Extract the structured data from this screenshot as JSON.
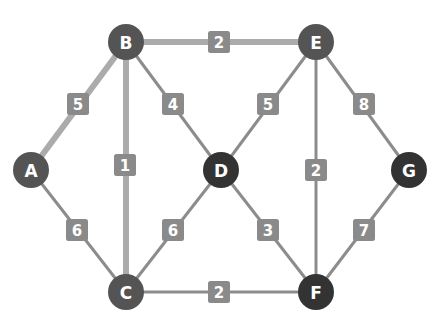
{
  "graph": {
    "title": "Weighted undirected graph",
    "colors": {
      "background": "#ffffff",
      "node_medium": "#545454",
      "node_dark": "#333333",
      "edge_normal": "#8c8c8c",
      "edge_highlight": "#ababab",
      "label_box": "#8a8a8a",
      "label_text": "#ffffff"
    },
    "nodes": [
      {
        "id": "A",
        "label": "A",
        "x": 31,
        "y": 170,
        "tone": "medium"
      },
      {
        "id": "B",
        "label": "B",
        "x": 126,
        "y": 42,
        "tone": "medium"
      },
      {
        "id": "C",
        "label": "C",
        "x": 126,
        "y": 292,
        "tone": "medium"
      },
      {
        "id": "D",
        "label": "D",
        "x": 221,
        "y": 170,
        "tone": "dark"
      },
      {
        "id": "E",
        "label": "E",
        "x": 316,
        "y": 42,
        "tone": "medium"
      },
      {
        "id": "F",
        "label": "F",
        "x": 316,
        "y": 292,
        "tone": "dark"
      },
      {
        "id": "G",
        "label": "G",
        "x": 409,
        "y": 170,
        "tone": "dark"
      }
    ],
    "edges": [
      {
        "from": "A",
        "to": "B",
        "weight": "5",
        "highlighted": true,
        "label_x": 78,
        "label_y": 104
      },
      {
        "from": "B",
        "to": "E",
        "weight": "2",
        "highlighted": true,
        "label_x": 219,
        "label_y": 42
      },
      {
        "from": "B",
        "to": "C",
        "weight": "1",
        "highlighted": true,
        "label_x": 125,
        "label_y": 165
      },
      {
        "from": "B",
        "to": "D",
        "weight": "4",
        "highlighted": false,
        "label_x": 173,
        "label_y": 104
      },
      {
        "from": "A",
        "to": "C",
        "weight": "6",
        "highlighted": false,
        "label_x": 77,
        "label_y": 230
      },
      {
        "from": "C",
        "to": "D",
        "weight": "6",
        "highlighted": false,
        "label_x": 173,
        "label_y": 230
      },
      {
        "from": "C",
        "to": "F",
        "weight": "2",
        "highlighted": false,
        "label_x": 219,
        "label_y": 292
      },
      {
        "from": "E",
        "to": "D",
        "weight": "5",
        "highlighted": false,
        "label_x": 268,
        "label_y": 104
      },
      {
        "from": "E",
        "to": "F",
        "weight": "2",
        "highlighted": false,
        "label_x": 316,
        "label_y": 170
      },
      {
        "from": "E",
        "to": "G",
        "weight": "8",
        "highlighted": false,
        "label_x": 364,
        "label_y": 104
      },
      {
        "from": "D",
        "to": "F",
        "weight": "3",
        "highlighted": false,
        "label_x": 268,
        "label_y": 230
      },
      {
        "from": "F",
        "to": "G",
        "weight": "7",
        "highlighted": false,
        "label_x": 364,
        "label_y": 230
      }
    ]
  }
}
